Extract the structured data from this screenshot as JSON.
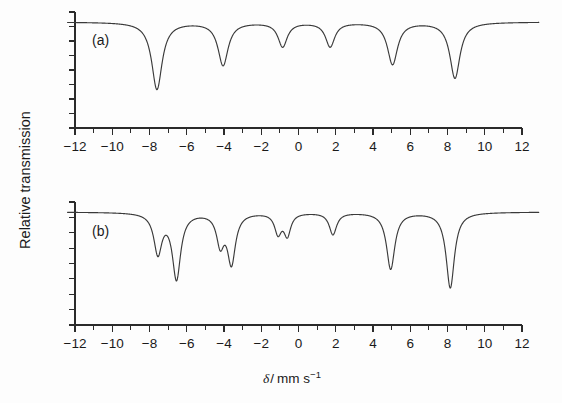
{
  "figure": {
    "background_color": "#fdfdfd",
    "curve_color": "#3a3a3a",
    "axis_color": "#2b2b2b",
    "ylabel": "Relative transmission",
    "xlabel_symbol": "δ",
    "xlabel_separator": "/",
    "xlabel_unit": "mm s",
    "xlabel_exponent": "−1",
    "panel_a_tag": "(a)",
    "panel_b_tag": "(b)"
  },
  "chart_data": {
    "type": "line",
    "title": "",
    "xlabel": "δ / mm s⁻¹",
    "ylabel": "Relative transmission",
    "xlim": [
      -12,
      12
    ],
    "ylim": [
      0,
      1.05
    ],
    "grid": false,
    "legend": null,
    "xticks_major": [
      -12,
      -10,
      -8,
      -6,
      -4,
      -2,
      0,
      2,
      4,
      6,
      8,
      10,
      12
    ],
    "xtick_labels": [
      "−12",
      "−10",
      "−8",
      "−6",
      "−4",
      "−2",
      "0",
      "2",
      "4",
      "6",
      "8",
      "10",
      "12"
    ],
    "xticks_minor_step": 1,
    "yticks_count": 8,
    "ytick_labels": [],
    "panels": [
      {
        "id": "a",
        "tag": "(a)",
        "description": "Magnetically split sextet, six absorption lines",
        "baseline": 1.0,
        "peaks": [
          {
            "center": -7.6,
            "depth": 0.72,
            "width": 0.34
          },
          {
            "center": -4.05,
            "depth": 0.46,
            "width": 0.33
          },
          {
            "center": -0.85,
            "depth": 0.26,
            "width": 0.3
          },
          {
            "center": 1.7,
            "depth": 0.26,
            "width": 0.3
          },
          {
            "center": 5.05,
            "depth": 0.45,
            "width": 0.33
          },
          {
            "center": 8.4,
            "depth": 0.6,
            "width": 0.33
          }
        ]
      },
      {
        "id": "b",
        "tag": "(b)",
        "description": "Sextet with each line further split into a doublet by hyperfine interaction",
        "baseline": 1.0,
        "peaks": [
          {
            "center": -7.55,
            "depth": 0.4,
            "width": 0.26
          },
          {
            "center": -6.55,
            "depth": 0.66,
            "width": 0.27
          },
          {
            "center": -4.2,
            "depth": 0.3,
            "width": 0.24
          },
          {
            "center": -3.6,
            "depth": 0.5,
            "width": 0.26
          },
          {
            "center": -1.1,
            "depth": 0.2,
            "width": 0.22
          },
          {
            "center": -0.6,
            "depth": 0.22,
            "width": 0.22
          },
          {
            "center": 1.85,
            "depth": 0.22,
            "width": 0.24
          },
          {
            "center": 4.95,
            "depth": 0.57,
            "width": 0.27
          },
          {
            "center": 8.15,
            "depth": 0.76,
            "width": 0.27
          }
        ]
      }
    ]
  }
}
